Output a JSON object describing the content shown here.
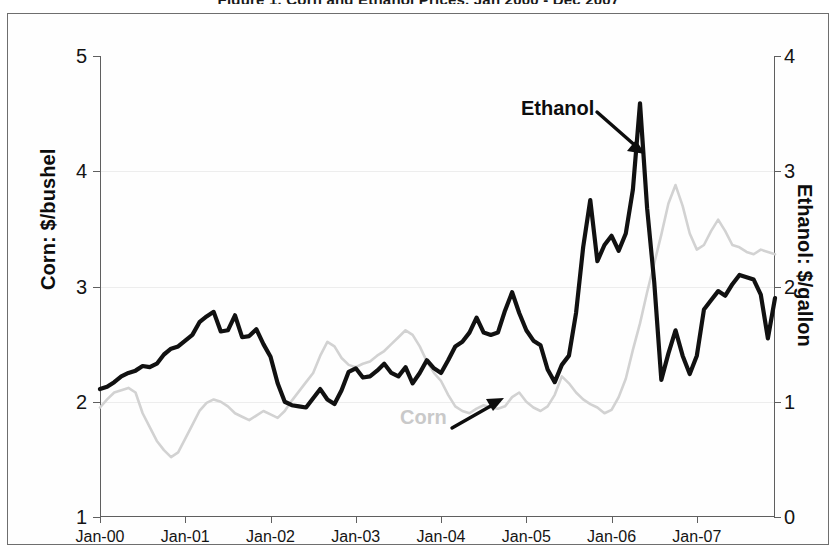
{
  "figure": {
    "title": "Figure 1. Corn and Ethanol Prices, Jan 2000 - Dec 2007"
  },
  "chart_data": {
    "type": "line",
    "title": "Corn and Ethanol Prices",
    "xlabel": "",
    "x_tick_labels": [
      "Jan-00",
      "Jan-01",
      "Jan-02",
      "Jan-03",
      "Jan-04",
      "Jan-05",
      "Jan-06",
      "Jan-07"
    ],
    "x_tick_values": [
      0,
      12,
      24,
      36,
      48,
      60,
      72,
      84
    ],
    "x_range": [
      0,
      95
    ],
    "grid": true,
    "legend_position": "inline-annotations",
    "left_axis": {
      "label": "Corn: $/bushel",
      "ylim": [
        1,
        5
      ],
      "ticks": [
        1,
        2,
        3,
        4,
        5
      ],
      "tick_labels": [
        "1",
        "2",
        "3",
        "4",
        "5"
      ]
    },
    "right_axis": {
      "label": "Ethanol: $/gallon",
      "ylim": [
        0,
        4
      ],
      "ticks": [
        0,
        1,
        2,
        3,
        4
      ],
      "tick_labels": [
        "0",
        "1",
        "2",
        "3",
        "4"
      ]
    },
    "annotations": [
      {
        "text": "Ethanol",
        "series": "ethanol",
        "color": "#0d0d0d",
        "arrow": "down-right"
      },
      {
        "text": "Corn",
        "series": "corn",
        "color": "#c9c9c9",
        "arrow": "up-right"
      }
    ],
    "series": [
      {
        "name": "Ethanol",
        "axis": "right",
        "unit": "$/gallon",
        "color": "#111111",
        "style": "solid-bold",
        "values": [
          1.11,
          1.13,
          1.17,
          1.22,
          1.25,
          1.27,
          1.31,
          1.3,
          1.33,
          1.41,
          1.46,
          1.48,
          1.53,
          1.58,
          1.69,
          1.74,
          1.78,
          1.61,
          1.62,
          1.75,
          1.56,
          1.57,
          1.63,
          1.5,
          1.39,
          1.16,
          1.0,
          0.97,
          0.96,
          0.95,
          1.03,
          1.11,
          1.02,
          0.98,
          1.1,
          1.26,
          1.29,
          1.21,
          1.22,
          1.27,
          1.33,
          1.25,
          1.22,
          1.3,
          1.16,
          1.25,
          1.36,
          1.29,
          1.25,
          1.36,
          1.48,
          1.52,
          1.6,
          1.73,
          1.6,
          1.58,
          1.6,
          1.79,
          1.95,
          1.77,
          1.62,
          1.53,
          1.49,
          1.28,
          1.17,
          1.32,
          1.4,
          1.77,
          2.34,
          2.75,
          2.22,
          2.36,
          2.44,
          2.31,
          2.46,
          2.84,
          3.59,
          2.68,
          2.04,
          1.19,
          1.42,
          1.62,
          1.4,
          1.24,
          1.4,
          1.8,
          1.88,
          1.96,
          1.92,
          2.02,
          2.1,
          2.08,
          2.06,
          1.93,
          1.55,
          1.9
        ]
      },
      {
        "name": "Corn",
        "axis": "left",
        "unit": "$/bushel",
        "color": "#d2d2d2",
        "style": "solid-light",
        "values": [
          1.95,
          2.02,
          2.08,
          2.1,
          2.12,
          2.08,
          1.9,
          1.78,
          1.66,
          1.58,
          1.52,
          1.56,
          1.68,
          1.8,
          1.92,
          1.99,
          2.02,
          2.0,
          1.96,
          1.9,
          1.87,
          1.84,
          1.88,
          1.92,
          1.89,
          1.86,
          1.92,
          2.01,
          2.09,
          2.17,
          2.25,
          2.4,
          2.52,
          2.48,
          2.38,
          2.32,
          2.3,
          2.33,
          2.35,
          2.4,
          2.44,
          2.5,
          2.56,
          2.62,
          2.58,
          2.48,
          2.35,
          2.25,
          2.18,
          2.06,
          1.96,
          1.92,
          1.9,
          1.94,
          1.97,
          1.95,
          1.94,
          1.96,
          2.04,
          2.08,
          2.0,
          1.95,
          1.92,
          1.96,
          2.06,
          2.22,
          2.16,
          2.08,
          2.02,
          1.98,
          1.95,
          1.9,
          1.93,
          2.04,
          2.2,
          2.45,
          2.68,
          2.95,
          3.2,
          3.45,
          3.72,
          3.88,
          3.7,
          3.46,
          3.32,
          3.36,
          3.48,
          3.58,
          3.48,
          3.36,
          3.34,
          3.3,
          3.28,
          3.32,
          3.3,
          3.28
        ]
      }
    ]
  }
}
